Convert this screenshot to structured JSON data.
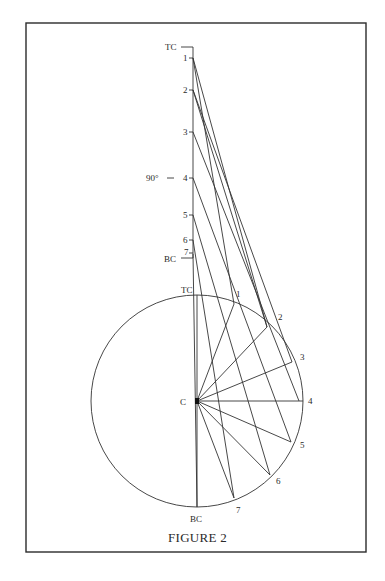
{
  "figure": {
    "caption": "FIGURE 2",
    "axis": {
      "top_label": "TC",
      "bottom_label": "BC",
      "angle_label": "90°",
      "tick_labels": [
        "1",
        "2",
        "3",
        "4",
        "5",
        "6",
        "7"
      ]
    },
    "circle": {
      "center_label": "C",
      "top_label": "TC",
      "bottom_label": "BC",
      "point_labels": [
        "1",
        "2",
        "3",
        "4",
        "5",
        "6",
        "7"
      ]
    }
  }
}
